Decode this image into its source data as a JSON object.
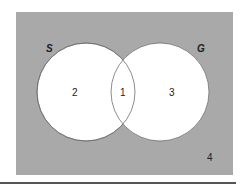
{
  "diagram": {
    "type": "venn",
    "background_color": "#a9a9a9",
    "circle_fill": "#ffffff",
    "circle_stroke": "#6e6e6e",
    "sets": [
      {
        "name": "S",
        "label": "S"
      },
      {
        "name": "G",
        "label": "G"
      }
    ],
    "regions": [
      {
        "id": "S_only",
        "label": "2"
      },
      {
        "id": "S_and_G",
        "label": "1"
      },
      {
        "id": "G_only",
        "label": "3"
      },
      {
        "id": "neither",
        "label": "4"
      }
    ]
  }
}
